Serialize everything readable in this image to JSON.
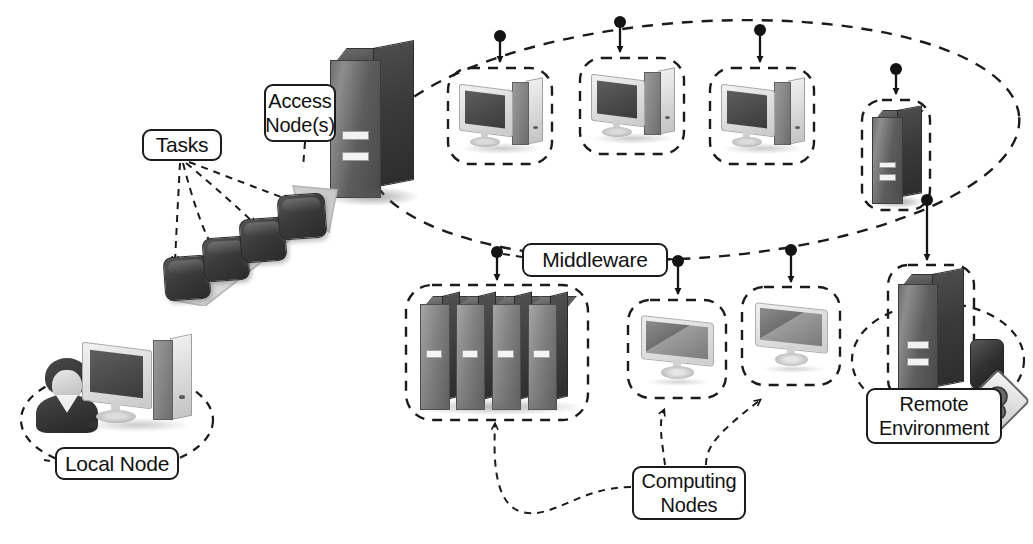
{
  "diagram": {
    "background_color": "#ffffff",
    "line_color": "#1b1b1b",
    "labels": {
      "tasks": "Tasks",
      "access_node_line1": "Access",
      "access_node_line2": "Node(s)",
      "middleware": "Middleware",
      "computing_nodes_line1": "Computing",
      "computing_nodes_line2": "Nodes",
      "remote_environment_line1": "Remote",
      "remote_environment_line2": "Environment",
      "local_node": "Local Node"
    },
    "groups": [
      {
        "name": "local-node-group",
        "shape": "dashed-ellipse",
        "label": "Local Node",
        "contents": [
          "user-avatar-icon",
          "desktop-pc-icon"
        ]
      },
      {
        "name": "tasks-group",
        "shape": "rounded-label",
        "label": "Tasks",
        "contents": [
          "task-cube",
          "task-cube",
          "task-cube",
          "task-cube",
          "ascending-arrow-icon"
        ]
      },
      {
        "name": "access-node-group",
        "shape": "rounded-label",
        "label": "Access Node(s)",
        "contents": [
          "server-tower-icon"
        ]
      },
      {
        "name": "middleware-cloud",
        "shape": "dashed-ellipse",
        "label": "Middleware",
        "contents": [
          "desktop-pc-node-1",
          "desktop-pc-node-2",
          "desktop-pc-node-3",
          "server-tower-node-4"
        ]
      },
      {
        "name": "computing-nodes-group",
        "shape": "rounded-label",
        "label": "Computing Nodes",
        "contents": [
          "server-rack-cluster",
          "monitor-node-1",
          "monitor-node-2"
        ]
      },
      {
        "name": "remote-environment-group",
        "shape": "dashed-ellipse",
        "label": "Remote Environment",
        "contents": [
          "server-tower-icon",
          "storage-box-icon",
          "gear-badge-icon"
        ]
      }
    ],
    "node_boxes": [
      {
        "name": "ellipse-pc-1",
        "icon": "desktop-pc-icon",
        "style": "dashed-rounded-box"
      },
      {
        "name": "ellipse-pc-2",
        "icon": "desktop-pc-icon",
        "style": "dashed-rounded-box"
      },
      {
        "name": "ellipse-pc-3",
        "icon": "desktop-pc-icon",
        "style": "dashed-rounded-box"
      },
      {
        "name": "ellipse-server-4",
        "icon": "server-tower-icon",
        "style": "dashed-rounded-box"
      },
      {
        "name": "rack-cluster-box",
        "icon": "server-rack-icon",
        "style": "dashed-rounded-box"
      },
      {
        "name": "monitor-box-1",
        "icon": "monitor-icon",
        "style": "dashed-rounded-box"
      },
      {
        "name": "monitor-box-2",
        "icon": "monitor-icon",
        "style": "dashed-rounded-box"
      },
      {
        "name": "remote-server-box",
        "icon": "server-tower-icon",
        "style": "dashed-rounded-box"
      }
    ],
    "connector_count": {
      "tasks_to_cubes": 4,
      "middleware_arrows_into_nodes": 8,
      "computing_nodes_pointers": 3
    }
  }
}
